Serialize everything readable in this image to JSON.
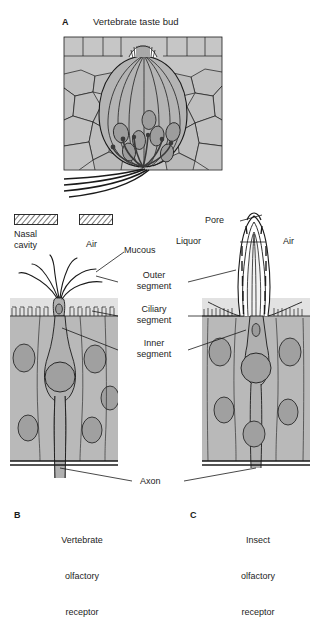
{
  "figure": {
    "type": "scientific-illustration",
    "panels": [
      {
        "letter": "A",
        "title": "Vertebrate taste bud"
      },
      {
        "letter": "B",
        "title": "Vertebrate\nolfactory\nreceptor"
      },
      {
        "letter": "C",
        "title": "Insect\nolfactory\nreceptor"
      }
    ]
  },
  "panel_a": {
    "letter": "A",
    "title": "Vertebrate taste bud"
  },
  "legend": {
    "items": [
      {
        "swatch": "hatched",
        "label": "Nasal\ncavity"
      },
      {
        "swatch": "hatched",
        "label": "Air"
      }
    ]
  },
  "labels": {
    "nasal_cavity": "Nasal\ncavity",
    "air_left": "Air",
    "air_right": "Air",
    "mucous": "Mucous",
    "outer_segment": "Outer\nsegment",
    "ciliary_segment": "Ciliary\nsegment",
    "inner_segment": "Inner\nsegment",
    "pore": "Pore",
    "liquor": "Liquor",
    "axon": "Axon"
  },
  "panel_b": {
    "letter": "B",
    "title_line1": "Vertebrate",
    "title_line2": "olfactory",
    "title_line3": "receptor"
  },
  "panel_c": {
    "letter": "C",
    "title_line1": "Insect",
    "title_line2": "olfactory",
    "title_line3": "receptor"
  },
  "colors": {
    "ink": "#1a1a1a",
    "epithelium": "#b8b8b8",
    "mucous_layer": "#dcdcdc",
    "cell_body": "#a8a8a8",
    "nucleus": "#9a9a9a",
    "taste_bud": "#b0b0b0",
    "background": "#ffffff"
  }
}
